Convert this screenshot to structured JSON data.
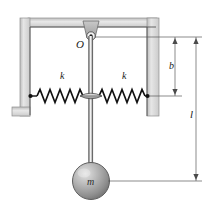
{
  "figure": {
    "type": "mechanics-diagram",
    "labels": {
      "pivot": "O",
      "spring_left": "k",
      "spring_right": "k",
      "dim_b": "b",
      "dim_l": "l",
      "mass": "m"
    },
    "icons": {
      "pivot": "pivot-point-icon",
      "left_spring": "coil-spring-icon",
      "right_spring": "coil-spring-icon",
      "bob": "sphere-mass-icon",
      "collar": "rod-collar-icon"
    },
    "colors": {
      "line": "#333333",
      "wall_fill": "#d9d9d9",
      "wall_edge": "#9a9a9a",
      "bob_light": "#cfcfcf",
      "bob_dark": "#7d7d7d",
      "dimension": "#555555",
      "background": "#ffffff"
    },
    "geometry": {
      "pivot_x": 91,
      "pivot_y": 36,
      "spring_line_y": 96,
      "bob_center_x": 91,
      "bob_center_y": 181,
      "bob_radius": 18,
      "dim_b_x": 175,
      "dim_l_x": 196,
      "dim_b_top_y": 37,
      "dim_b_bottom_y": 96,
      "dim_l_top_y": 37,
      "dim_l_bottom_y": 181
    }
  }
}
